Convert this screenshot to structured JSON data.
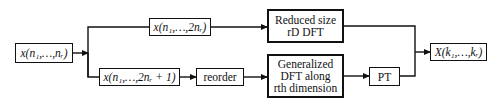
{
  "diagram": {
    "type": "block-diagram",
    "nodes": {
      "input": {
        "label": "x(n₁,…,nᵣ)"
      },
      "even_split": {
        "label": "x(n₁,…,2nᵣ)"
      },
      "odd_split": {
        "label": "x(n₁,…,2nᵣ + 1)"
      },
      "reorder": {
        "label": "reorder"
      },
      "reduced_dft": {
        "line1": "Reduced size",
        "line2": "rD DFT"
      },
      "generalized_dft": {
        "line1": "Generalized",
        "line2": "DFT along",
        "line3": "rth dimension"
      },
      "pt": {
        "label": "PT"
      },
      "output": {
        "label": "X(k₁,…,kᵣ)"
      }
    },
    "edges": [
      {
        "from": "input",
        "to": "even_split"
      },
      {
        "from": "input",
        "to": "odd_split"
      },
      {
        "from": "even_split",
        "to": "reduced_dft"
      },
      {
        "from": "odd_split",
        "to": "reorder"
      },
      {
        "from": "reorder",
        "to": "generalized_dft"
      },
      {
        "from": "generalized_dft",
        "to": "pt"
      },
      {
        "from": "reduced_dft",
        "to": "output"
      },
      {
        "from": "pt",
        "to": "output"
      }
    ],
    "colors": {
      "line": "#111111",
      "background": "#ffffff"
    }
  }
}
